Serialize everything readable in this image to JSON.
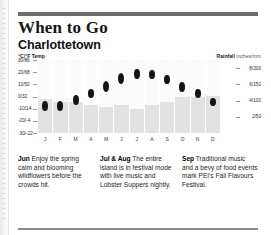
{
  "page": {
    "title": "When to Go",
    "subtitle": "Charlottetown"
  },
  "chart_axes": {
    "left_header_unit": "°C/°F",
    "left_header_label": "Temp",
    "right_header_unit": "Rainfall",
    "right_header_label": "inches/mm"
  },
  "blurbs": [
    {
      "month": "Jun",
      "text": " Enjoy the spring calm and blooming wildflowers before the crowds hit."
    },
    {
      "month": "Jul & Aug",
      "text": " The entire island is in festival mode with live music and Lobster Suppers nightly."
    },
    {
      "month": "Sep",
      "text": " Traditional music and a bevy of food events mark PEI's Fall Flavours Festival."
    }
  ],
  "chart_data": {
    "type": "bar",
    "subtitle": "Monthly temperature range and rainfall",
    "categories": [
      "J",
      "F",
      "M",
      "A",
      "M",
      "J",
      "J",
      "A",
      "S",
      "O",
      "N",
      "D"
    ],
    "xlabel": "",
    "grid": false,
    "legend_position": "none",
    "axes": {
      "left": {
        "label": "°C/°F Temp",
        "unit": "°C/°F",
        "ticks": [
          "30/86",
          "20/68",
          "10/50",
          "0/32",
          "-10/14",
          "-20/-4",
          "-30/-22"
        ],
        "tick_values_c": [
          30,
          20,
          10,
          0,
          -10,
          -20,
          -30
        ],
        "tick_values_f": [
          86,
          68,
          50,
          32,
          14,
          -4,
          -22
        ],
        "ylim_c": [
          -30,
          30
        ]
      },
      "right": {
        "label": "Rainfall inches/mm",
        "unit": "inches/mm",
        "ticks": [
          "8/200",
          "6/150",
          "4/100",
          "2/50"
        ],
        "tick_values_in": [
          8,
          6,
          4,
          2
        ],
        "tick_values_mm": [
          200,
          150,
          100,
          50
        ],
        "ylim_mm": [
          0,
          225
        ]
      }
    },
    "series": [
      {
        "name": "Rainfall",
        "type": "bar",
        "unit": "mm",
        "values": [
          105,
          95,
          95,
          85,
          80,
          85,
          75,
          85,
          95,
          110,
          110,
          115
        ]
      },
      {
        "name": "Temperature high",
        "type": "range-marker-top",
        "unit": "°C",
        "values": [
          -4,
          -4,
          1,
          6,
          13,
          19,
          23,
          22,
          18,
          12,
          6,
          -1
        ]
      },
      {
        "name": "Temperature low",
        "type": "range-marker-bottom",
        "unit": "°C",
        "values": [
          -12,
          -12,
          -7,
          -1,
          4,
          10,
          14,
          14,
          10,
          4,
          -1,
          -8
        ]
      }
    ]
  }
}
